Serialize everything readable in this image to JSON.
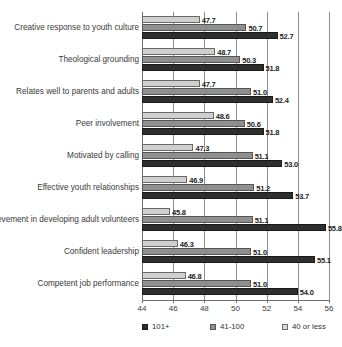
{
  "chart_data": {
    "type": "bar",
    "orientation": "horizontal",
    "title": "",
    "subtitle": "",
    "xlabel": "",
    "ylabel": "",
    "xlim": [
      44,
      56
    ],
    "xticks": [
      "44",
      "46",
      "48",
      "50",
      "52",
      "54",
      "56"
    ],
    "grid": "vertical",
    "legend_position": "bottom",
    "categories": [
      "Creative response to youth culture",
      "Theological grounding",
      "Relates well to parents and adults",
      "Peer involvement",
      "Motivated by calling",
      "Effective youth relationships",
      "Achievement in developing adult volunteers",
      "Confident leadership",
      "Competent job performance"
    ],
    "series": [
      {
        "name": "40 or less",
        "color": "#cfcfcf",
        "values": [
          47.7,
          48.7,
          47.7,
          48.6,
          47.3,
          46.9,
          45.8,
          46.3,
          46.8
        ],
        "labels": [
          "47.7",
          "48.7",
          "47.7",
          "48.6",
          "47.3",
          "46.9",
          "45.8",
          "46.3",
          "46.8"
        ]
      },
      {
        "name": "41-100",
        "color": "#8f8f8f",
        "values": [
          50.7,
          50.3,
          51.0,
          50.6,
          51.1,
          51.2,
          51.1,
          51.0,
          51.0
        ],
        "labels": [
          "50.7",
          "50.3",
          "51.0",
          "50.6",
          "51.1",
          "51.2",
          "51.1",
          "51.0",
          "51.0"
        ]
      },
      {
        "name": "101+",
        "color": "#2e2e2e",
        "values": [
          52.7,
          51.8,
          52.4,
          51.8,
          53.0,
          53.7,
          55.8,
          55.1,
          54.0
        ],
        "labels": [
          "52.7",
          "51.8",
          "52.4",
          "51.8",
          "53.0",
          "53.7",
          "55.8",
          "55.1",
          "54.0"
        ]
      }
    ],
    "legend": [
      {
        "label": "101+",
        "swatch": "s-dark"
      },
      {
        "label": "41-100",
        "swatch": "s-mid"
      },
      {
        "label": "40 or less",
        "swatch": "s-light"
      }
    ]
  }
}
